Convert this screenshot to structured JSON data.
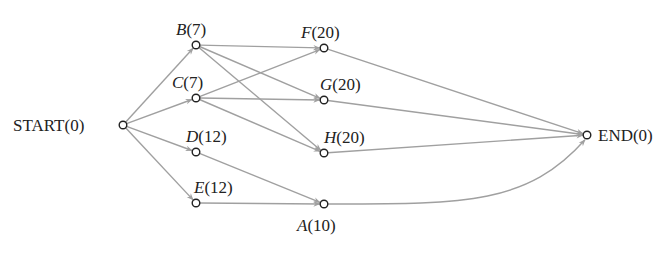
{
  "diagram": {
    "type": "activity-network",
    "colors": {
      "edge": "#a0a0a0",
      "node_stroke": "#222222",
      "text": "#222222",
      "background": "#ffffff"
    },
    "nodes": [
      {
        "id": "START",
        "letter": "START",
        "value": "(0)",
        "italic": false,
        "x": 123,
        "y": 125,
        "label_x": 13,
        "label_y": 131,
        "anchor": "start"
      },
      {
        "id": "B",
        "letter": "B",
        "value": "(7)",
        "italic": true,
        "x": 196,
        "y": 45,
        "label_x": 176,
        "label_y": 35,
        "anchor": "start"
      },
      {
        "id": "C",
        "letter": "C",
        "value": "(7)",
        "italic": true,
        "x": 196,
        "y": 98,
        "label_x": 172,
        "label_y": 88,
        "anchor": "start"
      },
      {
        "id": "D",
        "letter": "D",
        "value": "(12)",
        "italic": true,
        "x": 196,
        "y": 152,
        "label_x": 186,
        "label_y": 142,
        "anchor": "start"
      },
      {
        "id": "E",
        "letter": "E",
        "value": "(12)",
        "italic": true,
        "x": 196,
        "y": 203,
        "label_x": 194,
        "label_y": 193,
        "anchor": "start"
      },
      {
        "id": "F",
        "letter": "F",
        "value": "(20)",
        "italic": true,
        "x": 324,
        "y": 48,
        "label_x": 301,
        "label_y": 38,
        "anchor": "start"
      },
      {
        "id": "G",
        "letter": "G",
        "value": "(20)",
        "italic": true,
        "x": 324,
        "y": 100,
        "label_x": 320,
        "label_y": 90,
        "anchor": "start"
      },
      {
        "id": "H",
        "letter": "H",
        "value": "(20)",
        "italic": true,
        "x": 324,
        "y": 153,
        "label_x": 324,
        "label_y": 143,
        "anchor": "start"
      },
      {
        "id": "A",
        "letter": "A",
        "value": "(10)",
        "italic": true,
        "x": 324,
        "y": 204,
        "label_x": 297,
        "label_y": 231,
        "anchor": "start"
      },
      {
        "id": "END",
        "letter": "END",
        "value": "(0)",
        "italic": false,
        "x": 587,
        "y": 135,
        "label_x": 598,
        "label_y": 141,
        "anchor": "start"
      }
    ],
    "edges": [
      {
        "from": "START",
        "to": "B"
      },
      {
        "from": "START",
        "to": "C"
      },
      {
        "from": "START",
        "to": "D"
      },
      {
        "from": "START",
        "to": "E"
      },
      {
        "from": "B",
        "to": "F"
      },
      {
        "from": "B",
        "to": "G"
      },
      {
        "from": "B",
        "to": "H"
      },
      {
        "from": "C",
        "to": "F"
      },
      {
        "from": "C",
        "to": "G"
      },
      {
        "from": "C",
        "to": "H"
      },
      {
        "from": "D",
        "to": "A"
      },
      {
        "from": "E",
        "to": "A"
      },
      {
        "from": "F",
        "to": "END"
      },
      {
        "from": "G",
        "to": "END"
      },
      {
        "from": "H",
        "to": "END"
      },
      {
        "from": "A",
        "to": "END",
        "curved": true
      }
    ]
  }
}
